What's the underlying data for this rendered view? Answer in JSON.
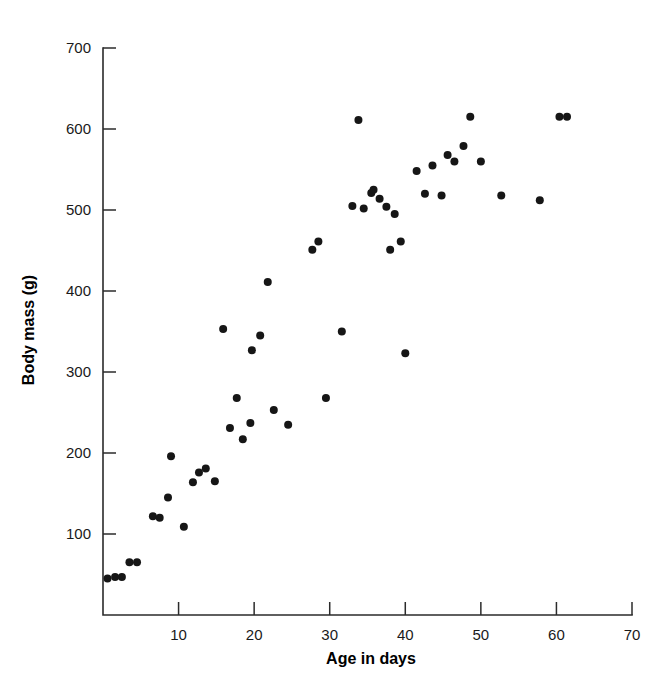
{
  "figure": {
    "top_partial_text": "",
    "background_color": "#ffffff",
    "point_color": "#161616",
    "axis_color": "#2b2b2b"
  },
  "chart_data": {
    "type": "scatter",
    "title": "",
    "xlabel": "Age in days",
    "ylabel": "Body mass (g)",
    "xlim": [
      0,
      70
    ],
    "ylim": [
      0,
      700
    ],
    "xticks": [
      10,
      20,
      30,
      40,
      50,
      60,
      70
    ],
    "yticks": [
      100,
      200,
      300,
      400,
      500,
      600,
      700
    ],
    "xtick_labels": [
      "10",
      "20",
      "30",
      "40",
      "50",
      "60",
      "70"
    ],
    "ytick_labels": [
      "100",
      "200",
      "300",
      "400",
      "500",
      "600",
      "700"
    ],
    "grid": false,
    "legend": null,
    "marker": "circle",
    "marker_size": 4,
    "n_points": 50,
    "series": [
      {
        "name": "Body mass by age",
        "points": [
          [
            0.6,
            45
          ],
          [
            1.6,
            47
          ],
          [
            2.5,
            47
          ],
          [
            3.5,
            65
          ],
          [
            4.5,
            65
          ],
          [
            6.6,
            122
          ],
          [
            7.5,
            120
          ],
          [
            8.6,
            145
          ],
          [
            9.0,
            196
          ],
          [
            10.7,
            109
          ],
          [
            11.9,
            164
          ],
          [
            12.7,
            176
          ],
          [
            13.6,
            181
          ],
          [
            14.8,
            165
          ],
          [
            15.9,
            353
          ],
          [
            16.8,
            231
          ],
          [
            17.7,
            268
          ],
          [
            18.5,
            217
          ],
          [
            19.5,
            237
          ],
          [
            19.7,
            327
          ],
          [
            20.8,
            345
          ],
          [
            21.8,
            411
          ],
          [
            22.6,
            253
          ],
          [
            24.5,
            235
          ],
          [
            27.7,
            451
          ],
          [
            28.5,
            461
          ],
          [
            29.5,
            268
          ],
          [
            31.6,
            350
          ],
          [
            33.0,
            505
          ],
          [
            33.8,
            611
          ],
          [
            34.5,
            502
          ],
          [
            35.5,
            521
          ],
          [
            35.8,
            525
          ],
          [
            36.6,
            514
          ],
          [
            37.5,
            504
          ],
          [
            38.0,
            451
          ],
          [
            38.6,
            495
          ],
          [
            39.4,
            461
          ],
          [
            40.0,
            323
          ],
          [
            41.5,
            548
          ],
          [
            42.6,
            520
          ],
          [
            43.6,
            555
          ],
          [
            44.8,
            518
          ],
          [
            45.6,
            568
          ],
          [
            46.5,
            560
          ],
          [
            47.7,
            579
          ],
          [
            48.6,
            615
          ],
          [
            50.0,
            560
          ],
          [
            52.7,
            518
          ],
          [
            57.8,
            512
          ],
          [
            60.4,
            615
          ],
          [
            61.4,
            615
          ]
        ]
      }
    ]
  }
}
